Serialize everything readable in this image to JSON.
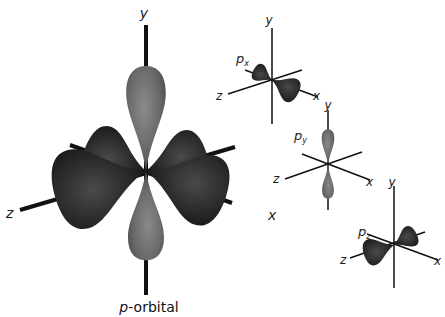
{
  "main": {
    "caption_italic": "p",
    "caption_rest": "-orbital",
    "axes": {
      "y": "y",
      "x": "x",
      "z": "z"
    }
  },
  "insets": [
    {
      "label": "p",
      "sub": "x",
      "axes": {
        "y": "y",
        "x": "x",
        "z": "z"
      }
    },
    {
      "label": "p",
      "sub": "y",
      "axes": {
        "y": "y",
        "x": "x",
        "z": "z"
      }
    },
    {
      "label": "p",
      "sub": "z",
      "axes": {
        "y": "y",
        "x": "x",
        "z": "z"
      }
    }
  ],
  "colors": {
    "y_lobe": "#6e6e6e",
    "xz_lobe": "#2e2e2e",
    "axis": "#111111",
    "background": "#ffffff"
  }
}
